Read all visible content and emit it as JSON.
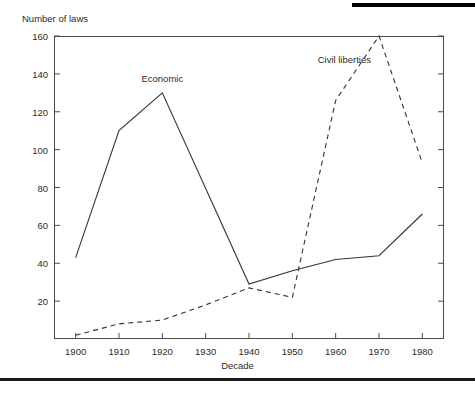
{
  "figure": {
    "y_axis_title": "Number of laws",
    "x_axis_title": "Decade"
  },
  "labels": {
    "economic": "Economic",
    "civil_liberties": "Civil liberties"
  },
  "chart_data": {
    "type": "line",
    "title": "",
    "xlabel": "Decade",
    "ylabel": "Number of laws",
    "x": [
      1900,
      1910,
      1920,
      1930,
      1940,
      1950,
      1960,
      1970,
      1980
    ],
    "xticklabels": [
      "1900",
      "1910",
      "1920",
      "1930",
      "1940",
      "1950",
      "1960",
      "1970",
      "1980"
    ],
    "yticks": [
      20,
      40,
      60,
      80,
      100,
      120,
      140,
      160
    ],
    "yticklabels": [
      "20",
      "40",
      "60",
      "80",
      "100",
      "120",
      "140",
      "160"
    ],
    "xlim": [
      1895,
      1985
    ],
    "ylim": [
      0,
      160
    ],
    "grid": false,
    "legend": "inline-annotations",
    "series": [
      {
        "name": "Economic",
        "style": "solid",
        "color": "#333333",
        "values": [
          43,
          110,
          130,
          80,
          29,
          36,
          42,
          44,
          66
        ],
        "vertices": [
          1900,
          1910,
          1920,
          1940,
          1950,
          1960,
          1970,
          1980
        ]
      },
      {
        "name": "Civil liberties",
        "style": "dashed",
        "color": "#333333",
        "values": [
          2,
          8,
          10,
          18,
          27,
          22,
          126,
          160,
          93
        ],
        "vertices": [
          1900,
          1910,
          1920,
          1930,
          1940,
          1950,
          1960,
          1970,
          1980
        ]
      }
    ],
    "annotations": [
      {
        "text": "Economic",
        "x": 1920,
        "y": 138
      },
      {
        "text": "Civil liberties",
        "x": 1962,
        "y": 148
      }
    ]
  }
}
